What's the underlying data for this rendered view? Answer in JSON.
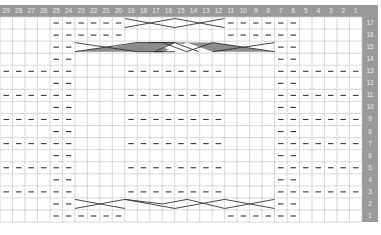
{
  "chart": {
    "columns": [
      29,
      28,
      27,
      26,
      25,
      24,
      23,
      22,
      21,
      20,
      19,
      18,
      17,
      16,
      15,
      14,
      13,
      12,
      11,
      10,
      9,
      8,
      7,
      6,
      5,
      4,
      3,
      2,
      1
    ],
    "rows": [
      17,
      16,
      15,
      14,
      13,
      12,
      11,
      10,
      9,
      8,
      7,
      6,
      5,
      4,
      3,
      2,
      1
    ],
    "colors": {
      "header": "#9a9a9a",
      "header_text": "#e8e8e8",
      "grid": "#c8c8c8",
      "symbol": "#333333",
      "shade": "#8c8c8c"
    },
    "legend_symbols": {
      "purl": "—",
      "blank": "knit",
      "cable": "cable cross"
    },
    "purl_cells": {
      "17": [
        [
          25,
          20
        ],
        [
          11,
          6
        ]
      ],
      "16": [
        [
          25,
          20
        ],
        [
          11,
          6
        ]
      ],
      "15": [
        [
          25,
          24
        ],
        [
          7,
          6
        ]
      ],
      "14": [
        [
          25,
          24
        ],
        [
          7,
          6
        ]
      ],
      "13": [
        [
          29,
          24
        ],
        [
          19,
          12
        ],
        [
          7,
          1
        ]
      ],
      "12": [
        [
          25,
          24
        ],
        [
          7,
          6
        ]
      ],
      "11": [
        [
          29,
          24
        ],
        [
          19,
          12
        ],
        [
          7,
          1
        ]
      ],
      "10": [
        [
          25,
          24
        ],
        [
          7,
          6
        ]
      ],
      "9": [
        [
          29,
          24
        ],
        [
          19,
          12
        ],
        [
          7,
          1
        ]
      ],
      "8": [
        [
          25,
          24
        ],
        [
          7,
          6
        ]
      ],
      "7": [
        [
          29,
          24
        ],
        [
          19,
          12
        ],
        [
          7,
          1
        ]
      ],
      "6": [
        [
          25,
          24
        ],
        [
          7,
          6
        ]
      ],
      "5": [
        [
          29,
          24
        ],
        [
          19,
          12
        ],
        [
          7,
          1
        ]
      ],
      "4": [
        [
          25,
          24
        ],
        [
          7,
          6
        ]
      ],
      "3": [
        [
          29,
          24
        ],
        [
          19,
          12
        ],
        [
          7,
          1
        ]
      ],
      "2": [
        [
          25,
          24
        ],
        [
          7,
          6
        ]
      ],
      "1": [
        [
          25,
          20
        ],
        [
          11,
          6
        ]
      ]
    },
    "cables": [
      {
        "row": 17,
        "from_col": 19,
        "to_col": 16,
        "type": "cross"
      },
      {
        "row": 17,
        "from_col": 15,
        "to_col": 12,
        "type": "cross"
      },
      {
        "row": 15,
        "from_col": 23,
        "to_col": 8,
        "type": "shaded-cross"
      },
      {
        "row": 2,
        "from_col": 23,
        "to_col": 20,
        "type": "cross"
      },
      {
        "row": 2,
        "from_col": 19,
        "to_col": 12,
        "type": "diamond"
      },
      {
        "row": 2,
        "from_col": 11,
        "to_col": 8,
        "type": "cross"
      }
    ]
  }
}
